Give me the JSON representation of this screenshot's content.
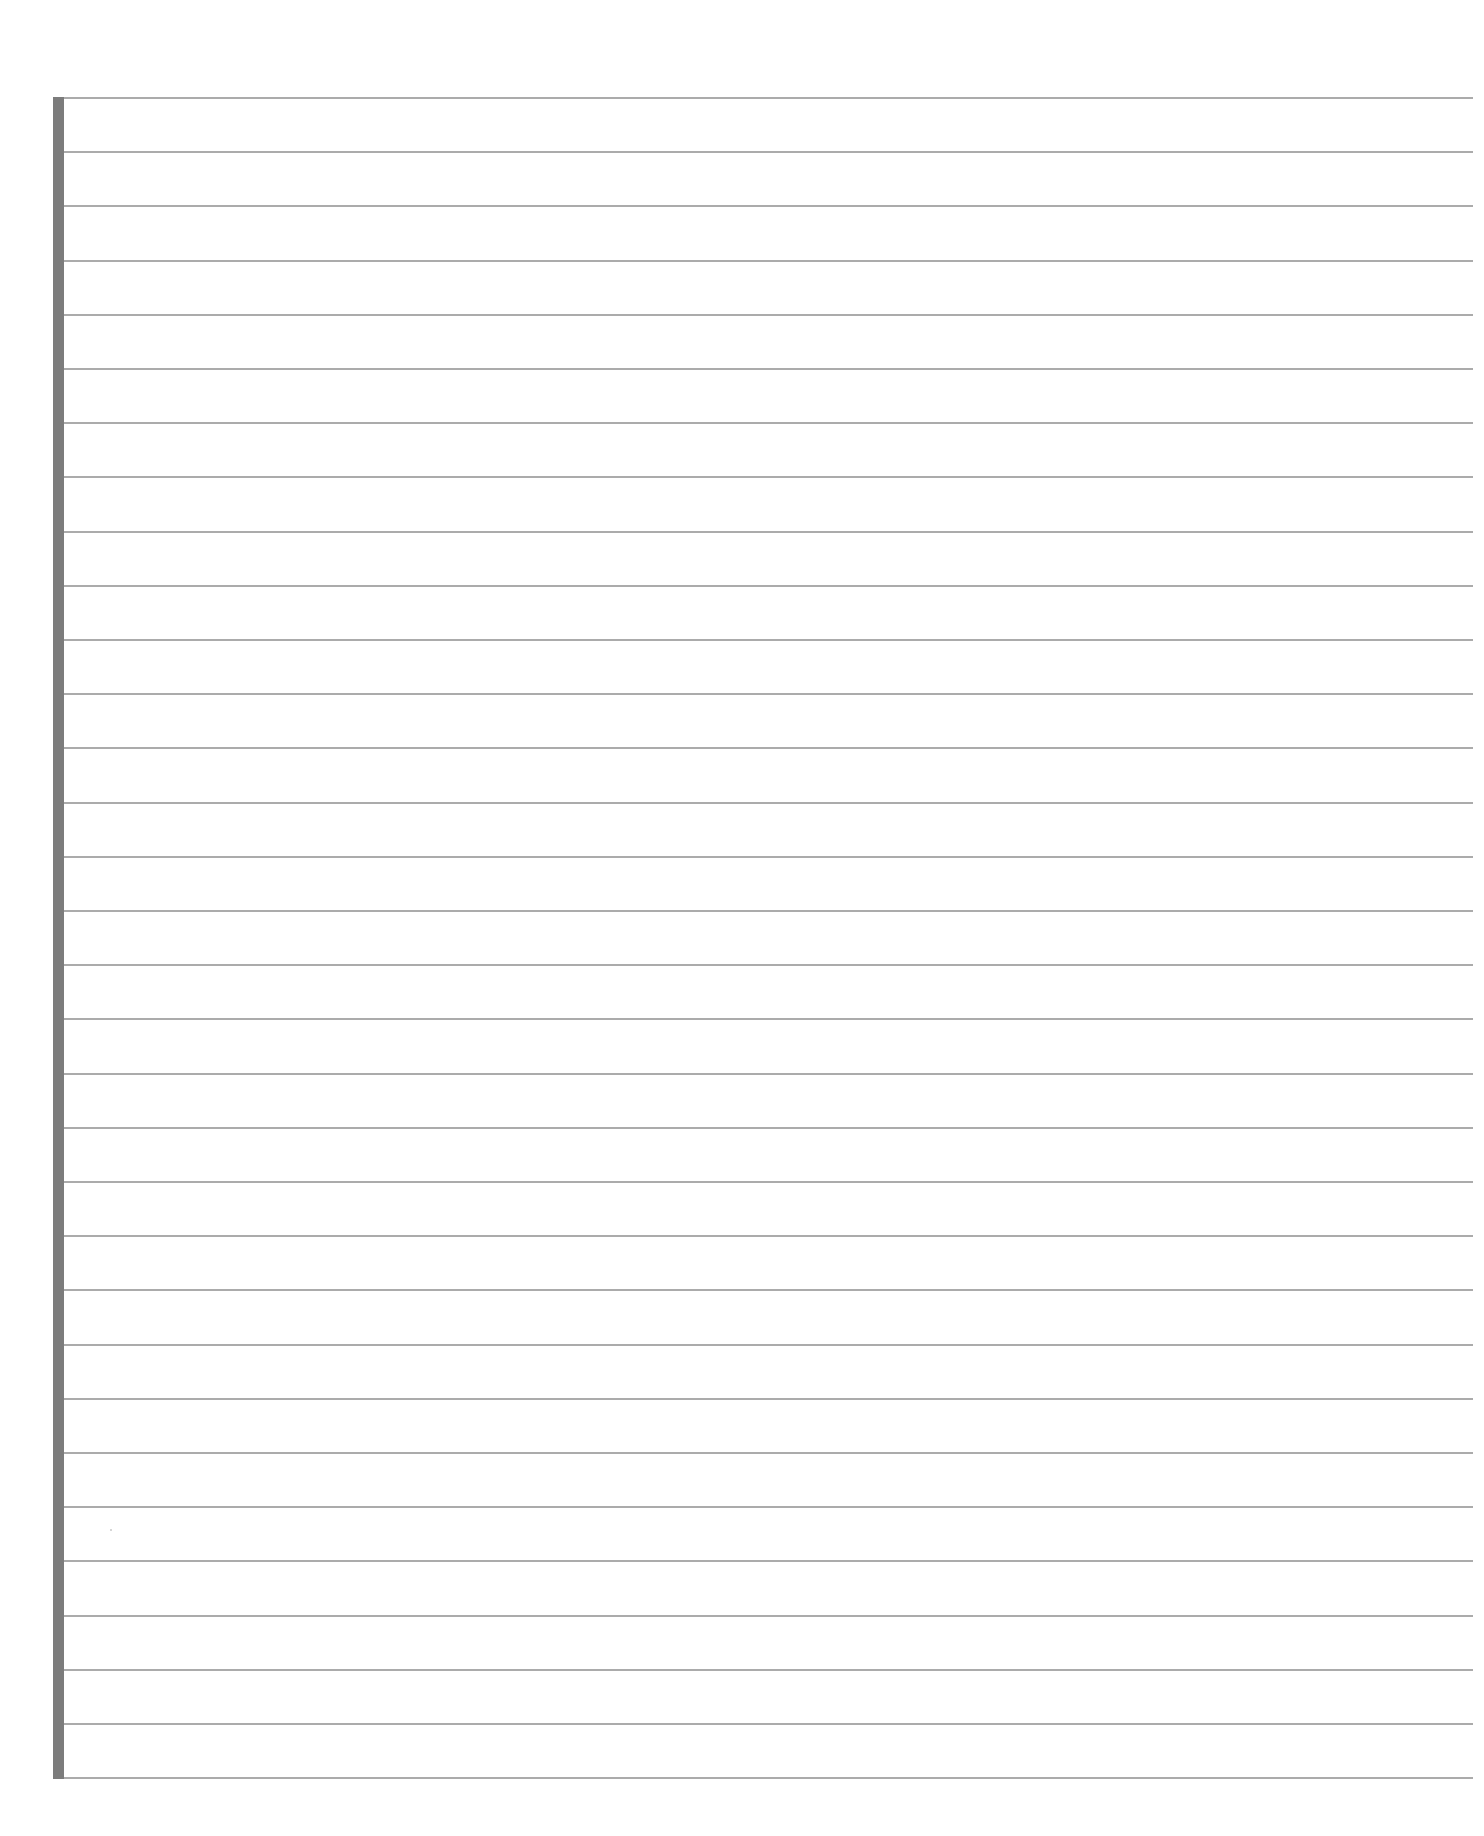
{
  "document": {
    "type": "lined-paper",
    "background_color": "#ffffff",
    "rule_color": "#ababab",
    "margin_bar_color": "#7c7c7c",
    "line_count": 32,
    "first_line_y": 97,
    "line_spacing": 54.2,
    "line_left_x": 64,
    "line_right_x": 1473,
    "margin_bar": {
      "x": 53,
      "width": 11,
      "top": 97,
      "bottom": 1779
    },
    "page_number": "",
    "page_number_note_visible": "partially cut off at bottom edge"
  }
}
